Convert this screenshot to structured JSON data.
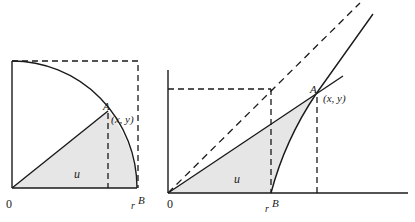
{
  "diagram": {
    "left_panel": {
      "origin_label": "0",
      "point_label": "A",
      "coord_label": "(x, y)",
      "area_label": "u",
      "r_label": "r",
      "b_label": "B",
      "description": "Unit circle quarter: shaded sector area u between ray OA and x-axis"
    },
    "right_panel": {
      "origin_label": "0",
      "point_label": "A",
      "coord_label": "(x, y)",
      "area_label": "u",
      "r_label": "r",
      "b_label": "B",
      "description": "Hyperbola: shaded hyperbolic sector area u between ray OA, x-axis and hyperbola from B to A"
    },
    "colors": {
      "stroke": "#1a1a1a",
      "shade": "#e6e6e6",
      "background": "#ffffff"
    }
  }
}
